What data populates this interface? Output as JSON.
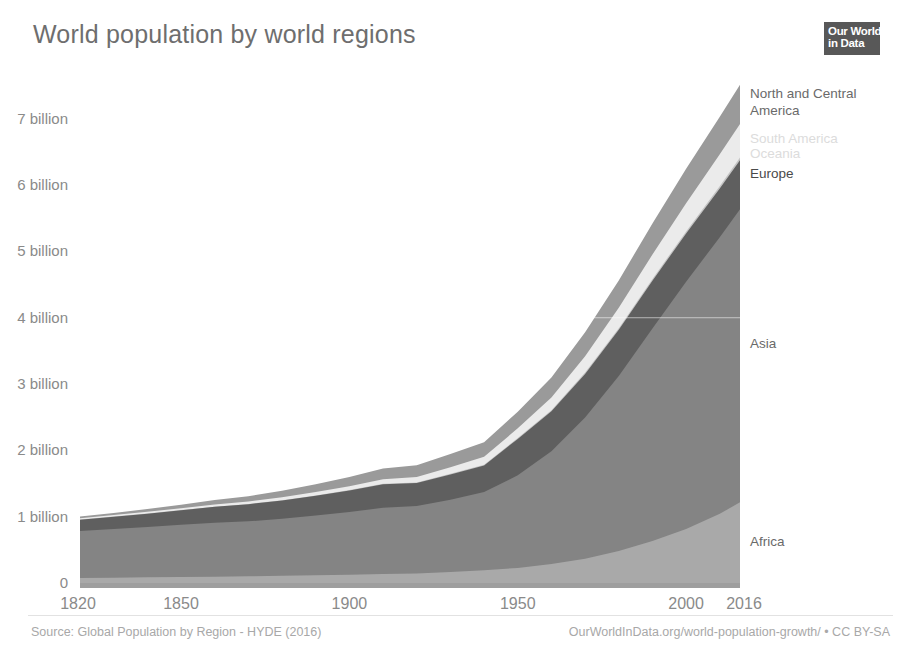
{
  "header": {
    "title": "World population by world regions",
    "logo": {
      "line1": "Our World",
      "line2": "in Data"
    }
  },
  "footer": {
    "source": "Source: Global Population by Region - HYDE (2016)",
    "link": "OurWorldInData.org/world-population-growth/ • CC BY-SA"
  },
  "chart_data": {
    "type": "area",
    "stacked": true,
    "title": "World population by world regions",
    "xlabel": "",
    "ylabel": "",
    "xlim": [
      1820,
      2016
    ],
    "ylim": [
      0,
      7.6
    ],
    "grid": "horizontal-faint",
    "legend_position": "right-inline",
    "y_tick_values": [
      0,
      1,
      2,
      3,
      4,
      5,
      6,
      7
    ],
    "y_tick_labels": [
      "0",
      "1 billion",
      "2 billion",
      "3 billion",
      "4 billion",
      "5 billion",
      "6 billion",
      "7 billion"
    ],
    "x_tick_values": [
      1820,
      1850,
      1900,
      1950,
      2000,
      2016
    ],
    "x_tick_labels": [
      "1820",
      "1850",
      "1900",
      "1950",
      "2000",
      "2016"
    ],
    "x": [
      1820,
      1830,
      1840,
      1850,
      1860,
      1870,
      1880,
      1890,
      1900,
      1910,
      1920,
      1930,
      1940,
      1950,
      1960,
      1970,
      1980,
      1990,
      2000,
      2010,
      2016
    ],
    "unit": "billions of people",
    "series": [
      {
        "name": "Africa",
        "color": "#a9a9a9",
        "label_color": "#6a6a6a",
        "label_faint": false,
        "values": [
          0.075,
          0.08,
          0.085,
          0.09,
          0.095,
          0.1,
          0.108,
          0.116,
          0.124,
          0.134,
          0.142,
          0.164,
          0.192,
          0.228,
          0.285,
          0.366,
          0.481,
          0.635,
          0.814,
          1.044,
          1.216
        ]
      },
      {
        "name": "Asia",
        "color": "#848484",
        "label_color": "#6a6a6a",
        "label_faint": false,
        "values": [
          0.71,
          0.735,
          0.76,
          0.79,
          0.815,
          0.83,
          0.86,
          0.9,
          0.947,
          1.0,
          1.02,
          1.09,
          1.18,
          1.396,
          1.7,
          2.13,
          2.642,
          3.202,
          3.73,
          4.17,
          4.42
        ]
      },
      {
        "name": "Europe",
        "color": "#5f5f5f",
        "label_color": "#4a4a4a",
        "label_faint": false,
        "values": [
          0.17,
          0.185,
          0.2,
          0.217,
          0.238,
          0.258,
          0.277,
          0.3,
          0.325,
          0.355,
          0.345,
          0.382,
          0.4,
          0.549,
          0.605,
          0.657,
          0.694,
          0.721,
          0.727,
          0.736,
          0.74
        ]
      },
      {
        "name": "Oceania",
        "color": "#c4c4c4",
        "label_color": "#dcdcdc",
        "label_faint": true,
        "values": [
          0.002,
          0.002,
          0.002,
          0.002,
          0.003,
          0.003,
          0.004,
          0.005,
          0.006,
          0.007,
          0.008,
          0.01,
          0.011,
          0.013,
          0.016,
          0.02,
          0.023,
          0.027,
          0.031,
          0.037,
          0.04
        ]
      },
      {
        "name": "South America",
        "color": "#ebebeb",
        "label_color": "#dcdcdc",
        "label_faint": true,
        "values": [
          0.021,
          0.023,
          0.026,
          0.029,
          0.033,
          0.037,
          0.043,
          0.05,
          0.058,
          0.069,
          0.082,
          0.099,
          0.119,
          0.146,
          0.191,
          0.247,
          0.31,
          0.37,
          0.426,
          0.478,
          0.507
        ]
      },
      {
        "name": "North and Central America",
        "color": "#9a9a9a",
        "label_color": "#6a6a6a",
        "label_faint": false,
        "values": [
          0.026,
          0.032,
          0.041,
          0.051,
          0.066,
          0.081,
          0.098,
          0.117,
          0.137,
          0.16,
          0.179,
          0.2,
          0.22,
          0.25,
          0.302,
          0.36,
          0.412,
          0.467,
          0.519,
          0.566,
          0.589
        ]
      }
    ],
    "series_labels": [
      {
        "name": "North and Central America",
        "lines": [
          "North and Central",
          "America"
        ],
        "y_px": 98,
        "faint": false
      },
      {
        "name": "South America",
        "lines": [
          "South America"
        ],
        "y_px": 143,
        "faint": true
      },
      {
        "name": "Oceania",
        "lines": [
          "Oceania"
        ],
        "y_px": 158,
        "faint": true
      },
      {
        "name": "Europe",
        "lines": [
          "Europe"
        ],
        "y_px": 178,
        "faint": false
      },
      {
        "name": "Asia",
        "lines": [
          "Asia"
        ],
        "y_px": 348,
        "faint": false
      },
      {
        "name": "Africa",
        "lines": [
          "Africa"
        ],
        "y_px": 546,
        "faint": false
      }
    ],
    "geometry": {
      "plot_left": 80,
      "plot_right": 740,
      "plot_top": 79,
      "plot_bottom": 583,
      "label_x": 750
    }
  }
}
